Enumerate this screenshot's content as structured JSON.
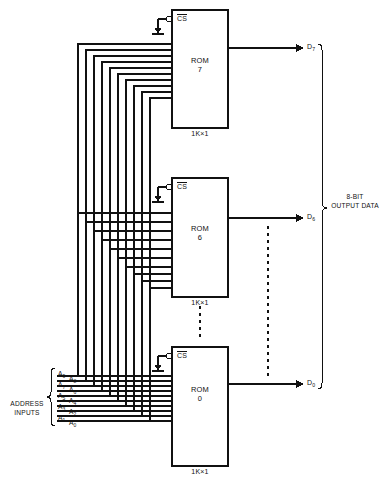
{
  "figure": {
    "type": "rom-array-expansion-schematic",
    "title": "",
    "line_color": "#111111",
    "background": "#ffffff"
  },
  "roms": [
    {
      "id": "rom7",
      "name_line1": "ROM",
      "name_line2": "7",
      "size": "1K×1",
      "cs_label": "CS",
      "cs_active_low": true,
      "output": "D",
      "output_sub": "7"
    },
    {
      "id": "rom6",
      "name_line1": "ROM",
      "name_line2": "6",
      "size": "1K×1",
      "cs_label": "CS",
      "cs_active_low": true,
      "output": "D",
      "output_sub": "6"
    },
    {
      "id": "rom0",
      "name_line1": "ROM",
      "name_line2": "0",
      "size": "1K×1",
      "cs_label": "CS",
      "cs_active_low": true,
      "output": "D",
      "output_sub": "0"
    }
  ],
  "address_inputs": {
    "group_label_line1": "ADDRESS",
    "group_label_line2": "INPUTS",
    "signals": [
      {
        "name": "A",
        "sub": "9"
      },
      {
        "name": "A",
        "sub": "8"
      },
      {
        "name": "A",
        "sub": "7"
      },
      {
        "name": "A",
        "sub": "6"
      },
      {
        "name": "A",
        "sub": "5"
      },
      {
        "name": "A",
        "sub": "4"
      },
      {
        "name": "A",
        "sub": "3"
      },
      {
        "name": "A",
        "sub": "2"
      },
      {
        "name": "A",
        "sub": "1"
      },
      {
        "name": "A",
        "sub": "0"
      }
    ]
  },
  "outputs": {
    "group_label_line1": "8-BIT",
    "group_label_line2": "OUTPUT DATA",
    "signals": [
      {
        "name": "D",
        "sub": "7"
      },
      {
        "name": "D",
        "sub": "6"
      },
      {
        "name": "D",
        "sub": "0"
      }
    ]
  }
}
